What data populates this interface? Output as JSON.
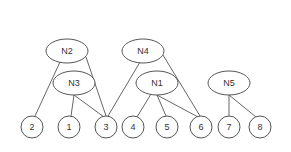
{
  "diagram": {
    "type": "tree-graph",
    "internal_nodes": [
      {
        "id": "N2",
        "label": "N2",
        "cx": 67,
        "cy": 51,
        "rx": 21,
        "ry": 12
      },
      {
        "id": "N4",
        "label": "N4",
        "cx": 143,
        "cy": 51,
        "rx": 21,
        "ry": 12
      },
      {
        "id": "N3",
        "label": "N3",
        "cx": 74,
        "cy": 83,
        "rx": 21,
        "ry": 12
      },
      {
        "id": "N1",
        "label": "N1",
        "cx": 157,
        "cy": 83,
        "rx": 21,
        "ry": 12
      },
      {
        "id": "N5",
        "label": "N5",
        "cx": 229,
        "cy": 83,
        "rx": 21,
        "ry": 12
      }
    ],
    "leaf_nodes": [
      {
        "id": "2",
        "label": "2",
        "cx": 32,
        "cy": 127,
        "r": 11
      },
      {
        "id": "1",
        "label": "1",
        "cx": 69,
        "cy": 127,
        "r": 11
      },
      {
        "id": "3",
        "label": "3",
        "cx": 106,
        "cy": 127,
        "r": 11
      },
      {
        "id": "4",
        "label": "4",
        "cx": 133,
        "cy": 127,
        "r": 11
      },
      {
        "id": "5",
        "label": "5",
        "cx": 167,
        "cy": 127,
        "r": 11
      },
      {
        "id": "6",
        "label": "6",
        "cx": 201,
        "cy": 127,
        "r": 11
      },
      {
        "id": "7",
        "label": "7",
        "cx": 229,
        "cy": 127,
        "r": 11
      },
      {
        "id": "8",
        "label": "8",
        "cx": 260,
        "cy": 127,
        "r": 11
      }
    ],
    "edges": [
      {
        "from": "N2",
        "to": "2",
        "x1": 60,
        "y1": 62,
        "x2": 35,
        "y2": 116
      },
      {
        "from": "N2",
        "to": "3",
        "x1": 86,
        "y1": 57,
        "x2": 106,
        "y2": 116
      },
      {
        "from": "N3",
        "to": "1",
        "x1": 74,
        "y1": 95,
        "x2": 71,
        "y2": 116
      },
      {
        "from": "N3",
        "to": "3",
        "x1": 74,
        "y1": 95,
        "x2": 104,
        "y2": 117
      },
      {
        "from": "N4",
        "to": "3",
        "x1": 140,
        "y1": 62,
        "x2": 108,
        "y2": 116
      },
      {
        "from": "N4",
        "to": "6",
        "x1": 163,
        "y1": 55,
        "x2": 200,
        "y2": 116
      },
      {
        "from": "N1",
        "to": "4",
        "x1": 151,
        "y1": 94,
        "x2": 137,
        "y2": 117
      },
      {
        "from": "N1",
        "to": "5",
        "x1": 157,
        "y1": 95,
        "x2": 166,
        "y2": 116
      },
      {
        "from": "N1",
        "to": "6",
        "x1": 157,
        "y1": 95,
        "x2": 198,
        "y2": 117
      },
      {
        "from": "N5",
        "to": "7",
        "x1": 229,
        "y1": 95,
        "x2": 229,
        "y2": 116
      },
      {
        "from": "N5",
        "to": "8",
        "x1": 229,
        "y1": 95,
        "x2": 256,
        "y2": 117
      }
    ],
    "colors": {
      "stroke": "#555555",
      "fill": "#ffffff",
      "text": "#333333"
    }
  }
}
